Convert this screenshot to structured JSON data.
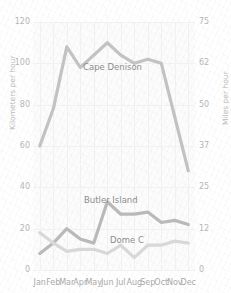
{
  "chart_data": {
    "type": "line",
    "title": "",
    "subtitle": "",
    "xlabel": "",
    "ylabel": "Kilometers per hour",
    "y2label": "Miles per hour",
    "categories": [
      "Jan",
      "Feb",
      "Mar",
      "Apr",
      "May",
      "Jun",
      "Jul",
      "Aug",
      "Sep",
      "Oct",
      "Nov",
      "Dec"
    ],
    "ylim": [
      0,
      120
    ],
    "yticks": [
      0,
      20,
      40,
      60,
      80,
      100,
      120
    ],
    "y2lim": [
      0,
      75
    ],
    "y2ticks": [
      0,
      12,
      25,
      37,
      50,
      62,
      75
    ],
    "grid": true,
    "legend": "inline-labels",
    "series": [
      {
        "name": "Cape Denison",
        "color": "#c2c2c2",
        "values": [
          60,
          78,
          108,
          98,
          104,
          110,
          104,
          100,
          102,
          100,
          74,
          48
        ]
      },
      {
        "name": "Butler Island",
        "color": "#b9b9b9",
        "values": [
          8,
          13,
          20,
          15,
          13,
          33,
          27,
          27,
          28,
          23,
          24,
          22
        ]
      },
      {
        "name": "Dome C",
        "color": "#d8d8d8",
        "values": [
          18,
          13,
          9,
          10,
          10,
          8,
          12,
          6,
          12,
          12,
          14,
          13
        ]
      }
    ],
    "annotations": [
      {
        "text": "Cape Denison",
        "series": "Cape Denison"
      },
      {
        "text": "Butler Island",
        "series": "Butler Island"
      },
      {
        "text": "Dome C",
        "series": "Dome C"
      }
    ]
  },
  "axes": {
    "left": {
      "title": "Kilometers per hour",
      "ticks": [
        "120",
        "100",
        "80",
        "60",
        "40",
        "20",
        "0"
      ]
    },
    "right": {
      "title": "Miles per hour",
      "ticks": [
        "75",
        "62",
        "50",
        "37",
        "25",
        "12",
        "0"
      ]
    },
    "bottom": {
      "ticks": [
        "Jan",
        "Feb",
        "Mar",
        "Apr",
        "May",
        "Jun",
        "Jul",
        "Aug",
        "Sep",
        "Oct",
        "Nov",
        "Dec"
      ]
    }
  },
  "labels": {
    "cape_denison": "Cape Denison",
    "butler_island": "Butler Island",
    "dome_c": "Dome C"
  },
  "colors": {
    "line_primary": "#c2c2c2",
    "line_secondary": "#b9b9b9",
    "line_tertiary": "#d8d8d8",
    "tick_text": "#b6b6b6",
    "axis_title": "#b9b9b9",
    "series_label": "#8d8d8d",
    "grid": "#f0f0f0",
    "background": "#ffffff"
  }
}
